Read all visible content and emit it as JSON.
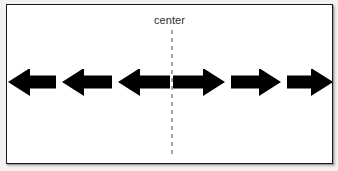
{
  "figure": {
    "label": "center",
    "background_color": "#ffffff",
    "panel_color": "#f2f2f2",
    "border_color": "#1b1b1b",
    "arrow_color": "#000000",
    "center_line_color": "#a8a8a8",
    "center_line_style": "dashed",
    "center_line_x": 171,
    "label_color": "#2e2e2e"
  },
  "chart_data": {
    "type": "diagram",
    "title": "center",
    "annotations": [
      "center"
    ],
    "center_line": {
      "x": 171,
      "y_top": 29,
      "y_bottom": 155,
      "style": "dashed",
      "label": "center"
    },
    "arrows": [
      {
        "index": 1,
        "direction": "left",
        "x_start": 8,
        "x_end": 56,
        "y_center": 81,
        "head_width": 22,
        "shaft_height": 13,
        "head_height": 28,
        "clipped": "left"
      },
      {
        "index": 2,
        "direction": "left",
        "x_start": 62,
        "x_end": 112,
        "y_center": 81,
        "head_width": 22,
        "shaft_height": 13,
        "head_height": 28,
        "clipped": "none"
      },
      {
        "index": 3,
        "direction": "left",
        "x_start": 118,
        "x_end": 170,
        "y_center": 81,
        "head_width": 22,
        "shaft_height": 13,
        "head_height": 28,
        "clipped": "none"
      },
      {
        "index": 4,
        "direction": "right",
        "x_start": 173,
        "x_end": 225,
        "y_center": 81,
        "head_width": 22,
        "shaft_height": 13,
        "head_height": 28,
        "clipped": "none"
      },
      {
        "index": 5,
        "direction": "right",
        "x_start": 231,
        "x_end": 281,
        "y_center": 81,
        "head_width": 22,
        "shaft_height": 13,
        "head_height": 28,
        "clipped": "none"
      },
      {
        "index": 6,
        "direction": "right",
        "x_start": 287,
        "x_end": 333,
        "y_center": 81,
        "head_width": 22,
        "shaft_height": 13,
        "head_height": 28,
        "clipped": "right"
      }
    ],
    "counts": {
      "left_arrows": 3,
      "right_arrows": 3,
      "total_arrows": 6
    },
    "grid": false,
    "legend": false
  }
}
